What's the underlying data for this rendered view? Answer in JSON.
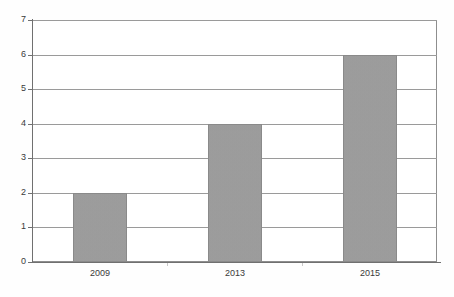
{
  "chart_data": {
    "type": "bar",
    "title": "",
    "subtitle": "",
    "xlabel": "",
    "ylabel": "",
    "categories": [
      "2009",
      "2013",
      "2015"
    ],
    "values": [
      2,
      4,
      6
    ],
    "series": [
      {
        "name": "",
        "values": [
          2,
          4,
          6
        ]
      }
    ],
    "ylim": [
      0,
      7
    ],
    "ytick_labels": [
      "0",
      "1",
      "2",
      "3",
      "4",
      "5",
      "6",
      "7"
    ],
    "ytick_values": [
      0,
      1,
      2,
      3,
      4,
      5,
      6,
      7
    ],
    "grid": "horizontal",
    "legend": "none",
    "annotations": [],
    "colors": {
      "bar_fill": "#9e9e9e",
      "bar_border": "#8a8a8a",
      "gridline": "#9a9a9a",
      "frame": "#8e8e8e",
      "axis": "#707070",
      "tick_text": "#3a3a3a",
      "background": "#ffffff"
    }
  }
}
